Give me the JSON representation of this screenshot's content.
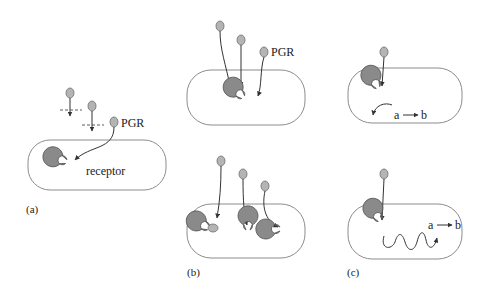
{
  "figure": {
    "panels": [
      {
        "id": "a",
        "label": "(a)",
        "ligand_label": "PGR",
        "receptor_label": "receptor"
      },
      {
        "id": "b",
        "label": "(b)",
        "ligand_label": "PGR"
      },
      {
        "id": "c",
        "label": "(c)",
        "reaction": {
          "from": "a",
          "to": "b"
        }
      }
    ]
  },
  "text": {
    "a_label": "(a)",
    "b_label": "(b)",
    "c_label": "(c)",
    "pgr_a": "PGR",
    "pgr_b": "PGR",
    "receptor": "receptor",
    "rxn_top_a": "a",
    "rxn_top_b": "b",
    "rxn_bot_a": "a",
    "rxn_bot_b": "b"
  },
  "colors": {
    "ligand": "#b4b4b4",
    "receptor": "#8a8a8a",
    "cell_border": "#8c8c8c"
  }
}
